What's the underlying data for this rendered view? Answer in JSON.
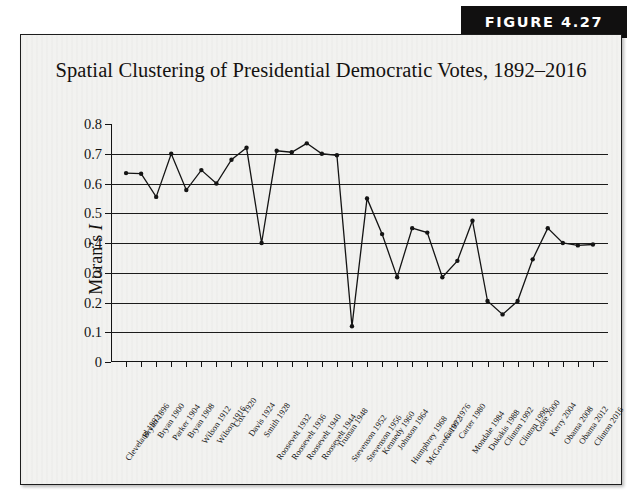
{
  "figure": {
    "banner_label": "FIGURE 4.27"
  },
  "chart_data": {
    "type": "line",
    "title": "Spatial Clustering of Presidential Democratic Votes, 1892–2016",
    "xlabel": "",
    "ylabel": "Moran's I",
    "ylim": [
      0,
      0.8
    ],
    "ytick_labels": [
      "0",
      "0.1",
      "0.2",
      "0.3",
      "0.4",
      "0.5",
      "0.6",
      "0.7",
      "0.8"
    ],
    "ytick_values": [
      0,
      0.1,
      0.2,
      0.3,
      0.4,
      0.5,
      0.6,
      0.7,
      0.8
    ],
    "gridlines_at": [
      0.1,
      0.2,
      0.3,
      0.4,
      0.5,
      0.6,
      0.7
    ],
    "grid": true,
    "legend": "none",
    "marker": "filled-circle",
    "line_color": "#141414",
    "categories": [
      "Cleveland 1892",
      "Bryan 1896",
      "Bryan 1900",
      "Parker 1904",
      "Bryan 1908",
      "Wilson 1912",
      "Wilson 1916",
      "Cox 1920",
      "Davis 1924",
      "Smith 1928",
      "Roosevelt 1932",
      "Roosevelt 1936",
      "Roosevelt 1940",
      "Roosevelt 1944",
      "Truman 1948",
      "Stevenson 1952",
      "Stevenson 1956",
      "Kennedy 1960",
      "Johnson 1964",
      "Humphrey 1968",
      "McGovern 1972",
      "Carter 1976",
      "Carter 1980",
      "Mondale 1984",
      "Dukakis 1988",
      "Clinton 1992",
      "Clinton 1996",
      "Gore 2000",
      "Kerry 2004",
      "Obama 2008",
      "Obama 2012",
      "Clinton 2016"
    ],
    "values": [
      0.635,
      0.633,
      0.555,
      0.7,
      0.578,
      0.645,
      0.6,
      0.68,
      0.72,
      0.4,
      0.71,
      0.705,
      0.735,
      0.7,
      0.695,
      0.12,
      0.55,
      0.43,
      0.285,
      0.45,
      0.435,
      0.285,
      0.34,
      0.475,
      0.205,
      0.16,
      0.205,
      0.345,
      0.45,
      0.4,
      0.392,
      0.395
    ]
  }
}
